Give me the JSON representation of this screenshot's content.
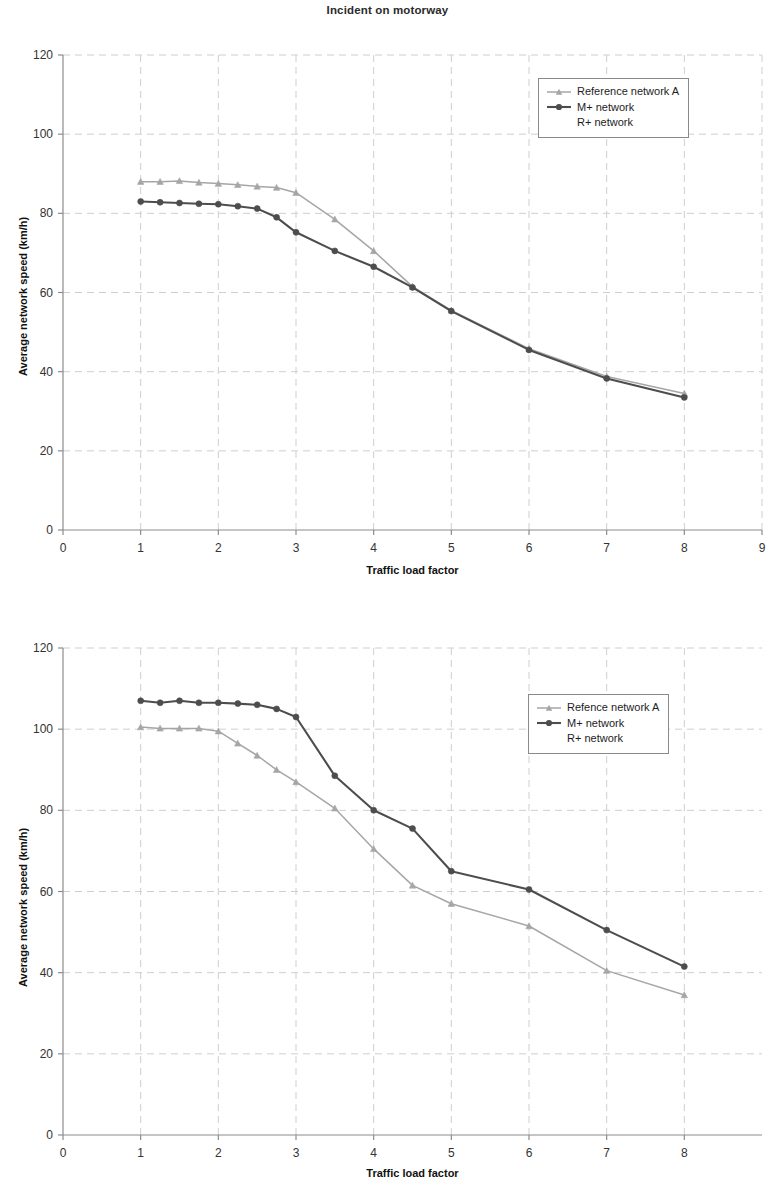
{
  "figures": [
    {
      "id": "motorway",
      "title": "Incident on motorway",
      "xlabel": "Traffic load factor",
      "ylabel": "Average network speed (km/h)",
      "legend": [
        {
          "label": "Reference network A",
          "marker": "triangle",
          "color": "#a6a6a6"
        },
        {
          "label": "M+ network",
          "marker": "circle",
          "color": "#4d4d4d"
        },
        {
          "label": "R+ network",
          "marker": "none",
          "color": "#4d4d4d"
        }
      ]
    },
    {
      "id": "regional",
      "title": "Incident on regional road",
      "xlabel": "Traffic load factor",
      "ylabel": "Average network speed (km/h)",
      "legend": [
        {
          "label": "Refence network A",
          "marker": "triangle",
          "color": "#a6a6a6"
        },
        {
          "label": "M+ network",
          "marker": "circle",
          "color": "#4d4d4d"
        },
        {
          "label": "R+ network",
          "marker": "none",
          "color": "#4d4d4d"
        }
      ]
    }
  ],
  "chart_data": [
    {
      "type": "line",
      "title": "Incident on motorway",
      "xlabel": "Traffic load factor",
      "ylabel": "Average network speed (km/h)",
      "xlim": [
        0,
        9
      ],
      "ylim": [
        0,
        120
      ],
      "xticks": [
        0,
        1,
        2,
        3,
        4,
        5,
        6,
        7,
        8,
        9
      ],
      "yticks": [
        0,
        20,
        40,
        60,
        80,
        100,
        120
      ],
      "grid": "dashed-light",
      "legend_position": "top-right-inside",
      "series": [
        {
          "name": "Reference network A",
          "color": "#a6a6a6",
          "marker": "triangle",
          "x": [
            1,
            1.25,
            1.5,
            1.75,
            2,
            2.25,
            2.5,
            2.75,
            3,
            3.5,
            4,
            4.5,
            5,
            6,
            7,
            8
          ],
          "values": [
            88,
            88,
            88.2,
            87.8,
            87.5,
            87.2,
            86.8,
            86.5,
            85.2,
            78.5,
            70.5,
            61.5,
            55.5,
            45.8,
            38.8,
            34.5
          ]
        },
        {
          "name": "M+ network",
          "color": "#4d4d4d",
          "marker": "circle",
          "x": [
            1,
            1.25,
            1.5,
            1.75,
            2,
            2.25,
            2.5,
            2.75,
            3,
            3.5,
            4,
            4.5,
            5,
            6,
            7,
            8
          ],
          "values": [
            83,
            82.8,
            82.6,
            82.4,
            82.3,
            81.8,
            81.2,
            79,
            75.2,
            70.5,
            66.5,
            61.3,
            55.3,
            45.5,
            38.3,
            33.5
          ]
        }
      ]
    },
    {
      "type": "line",
      "title": "Incident on regional road",
      "xlabel": "Traffic load factor",
      "ylabel": "Average network speed (km/h)",
      "xlim": [
        0,
        9
      ],
      "ylim": [
        0,
        120
      ],
      "xticks": [
        0,
        1,
        2,
        3,
        4,
        5,
        6,
        7,
        8
      ],
      "yticks": [
        0,
        20,
        40,
        60,
        80,
        100,
        120
      ],
      "grid": "dashed-light",
      "legend_position": "top-right-inside",
      "series": [
        {
          "name": "Refence network A",
          "color": "#a6a6a6",
          "marker": "triangle",
          "x": [
            1,
            1.25,
            1.5,
            1.75,
            2,
            2.25,
            2.5,
            2.75,
            3,
            3.5,
            4,
            4.5,
            5,
            6,
            7,
            8
          ],
          "values": [
            100.5,
            100.2,
            100.2,
            100.2,
            99.5,
            96.5,
            93.5,
            90,
            87,
            80.5,
            70.5,
            61.5,
            57,
            51.5,
            40.5,
            34.5
          ]
        },
        {
          "name": "M+ network",
          "color": "#4d4d4d",
          "marker": "circle",
          "x": [
            1,
            1.25,
            1.5,
            1.75,
            2,
            2.25,
            2.5,
            2.75,
            3,
            3.5,
            4,
            4.5,
            5,
            6,
            7,
            8
          ],
          "values": [
            107,
            106.5,
            107,
            106.5,
            106.5,
            106.3,
            106,
            105,
            103,
            88.5,
            80,
            75.5,
            65,
            60.5,
            50.5,
            41.5
          ]
        }
      ]
    }
  ]
}
